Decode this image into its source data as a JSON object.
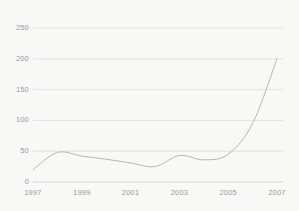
{
  "chart_data": {
    "type": "line",
    "title": "",
    "subtitle": "",
    "xlabel": "",
    "ylabel": "",
    "x": [
      1997,
      1998,
      1999,
      2000,
      2001,
      2002,
      2003,
      2004,
      2005,
      2006,
      2007
    ],
    "series": [
      {
        "name": "series-1",
        "values": [
          20,
          48,
          42,
          37,
          31,
          25,
          43,
          36,
          45,
          95,
          200
        ]
      }
    ],
    "xlim": [
      1997,
      2007
    ],
    "ylim": [
      0,
      250
    ],
    "ytick_labels": [
      "0",
      "50",
      "100",
      "150",
      "200",
      "250"
    ],
    "ytick_values": [
      0,
      50,
      100,
      150,
      200,
      250
    ],
    "xtick_labels": [
      "1997",
      "1999",
      "2001",
      "2003",
      "2005",
      "2007"
    ],
    "xtick_values": [
      1997,
      1999,
      2001,
      2003,
      2005,
      2007
    ],
    "grid": true,
    "grid_axis": "y",
    "legend": false,
    "legend_position": "none",
    "annotations": []
  },
  "style": {
    "background_color": "#f8f8f6",
    "line_color": "#b6b6b2",
    "grid_color": "#dcdcd8",
    "axis_color": "#cfcfca",
    "tick_label_color": "#9a9a96"
  }
}
